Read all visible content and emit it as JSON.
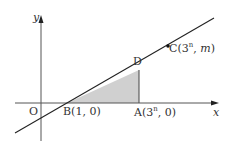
{
  "diagram": {
    "type": "coordinate-plane",
    "colors": {
      "axis": "#555555",
      "line": "#222222",
      "shade": "#d0d0d0",
      "shade_edge": "#444444"
    },
    "axes": {
      "x_label": "x",
      "y_label": "y",
      "origin_label": "O"
    },
    "points": {
      "B": {
        "name": "B",
        "coords": "(1, 0)"
      },
      "A": {
        "name": "A",
        "coords_prefix": "(3",
        "coords_exp": "n",
        "coords_suffix": ", 0)"
      },
      "D": {
        "name": "D"
      },
      "C": {
        "name": "C",
        "coords_prefix": "(3",
        "coords_exp": "n",
        "coords_mid": ", ",
        "coords_var": "m",
        "coords_suffix": ")"
      }
    },
    "shaded_region": "triangle BAD"
  }
}
